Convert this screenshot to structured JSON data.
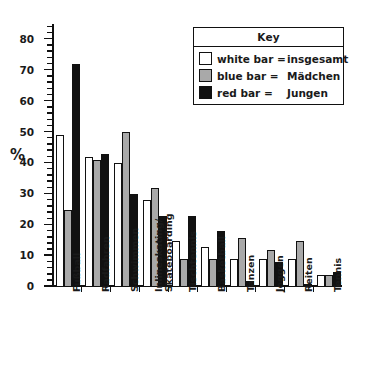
{
  "legend": {
    "title": "Key",
    "rows": [
      {
        "swatch": "white-swatch",
        "key": "white bar =",
        "value": "insgesamt"
      },
      {
        "swatch": "gray-swatch",
        "key": "blue bar =",
        "value": "Mädchen"
      },
      {
        "swatch": "black-swatch",
        "key": "red bar =",
        "value": "Jungen"
      }
    ]
  },
  "axis": {
    "ylabel": "%",
    "yticks": [
      "0",
      "10",
      "20",
      "30",
      "40",
      "50",
      "60",
      "70",
      "80"
    ]
  },
  "colors": {
    "white_bar": "#ffffff",
    "gray_bar": "#a9a9a9",
    "black_bar": "#111111",
    "axis": "#111111",
    "background": "#ffffff"
  },
  "chart_data": {
    "type": "bar",
    "title": "",
    "xlabel": "",
    "ylabel": "%",
    "ylim": [
      0,
      85
    ],
    "ytick_step": 10,
    "minor_tick_step": 2,
    "grid": false,
    "legend_position": "top-right",
    "categories": [
      "Fußball",
      "Radfahren",
      "Schwimmen",
      "Inlineskating/\nSkateboarding",
      "Tischtennis",
      "Basketball",
      "Tanzen",
      "Joggen",
      "Reiten",
      "Tennis"
    ],
    "category_lines": [
      [
        "Fußball"
      ],
      [
        "Radfahren"
      ],
      [
        "Schwimmen"
      ],
      [
        "Inlineskating/",
        "Skateboarding"
      ],
      [
        "Tischtennis"
      ],
      [
        "Basketball"
      ],
      [
        "Tanzen"
      ],
      [
        "Joggen"
      ],
      [
        "Reiten"
      ],
      [
        "Tennis"
      ]
    ],
    "series": [
      {
        "name": "insgesamt",
        "color": "#ffffff",
        "values": [
          49,
          42,
          40,
          28,
          15,
          13,
          9,
          9,
          9,
          4
        ]
      },
      {
        "name": "Mädchen",
        "color": "#a9a9a9",
        "values": [
          25,
          41,
          50,
          32,
          9,
          9,
          16,
          12,
          15,
          4
        ]
      },
      {
        "name": "Jungen",
        "color": "#111111",
        "values": [
          72,
          43,
          30,
          23,
          23,
          18,
          2,
          8,
          1,
          5
        ]
      }
    ]
  }
}
